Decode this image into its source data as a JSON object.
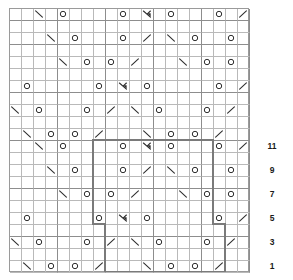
{
  "chart": {
    "type": "knitting-chart-grid",
    "columns": 20,
    "rows": 22,
    "cell_size_px": 12,
    "grid_color": "#b9b9b9",
    "major_grid_color": "#8d8d8d",
    "repeat_box_color": "#7a7a7a",
    "symbol_color": "#2e2e2e",
    "symbol_legend": {
      "O": "yarn-over",
      "/": "k2tog-right-leaning-decrease",
      "\\": "ssk-left-leaning-decrease",
      "A": "centered-double-decrease",
      "": "knit-blank"
    },
    "row_numbers": [
      {
        "label": "11",
        "row_index": 10
      },
      {
        "label": "9",
        "row_index": 8
      },
      {
        "label": "7",
        "row_index": 6
      },
      {
        "label": "5",
        "row_index": 4
      },
      {
        "label": "3",
        "row_index": 2
      },
      {
        "label": "1",
        "row_index": 0
      }
    ],
    "major_column_lines": [
      0,
      4,
      8,
      12,
      16,
      20
    ],
    "major_row_lines": [
      0,
      4,
      8,
      12,
      16,
      20,
      22
    ],
    "repeat_boxes": [
      {
        "name": "upper-repeat-box",
        "col_start": 7,
        "col_end": 17,
        "row_start": 4,
        "row_end": 11
      },
      {
        "name": "lower-repeat-box",
        "col_start": 8,
        "col_end": 18,
        "row_start": 0,
        "row_end": 4
      }
    ],
    "cells": [
      {
        "row": 21,
        "col": 4,
        "sym": "\\"
      },
      {
        "row": 21,
        "col": 6,
        "sym": "O"
      },
      {
        "row": 21,
        "col": 11,
        "sym": "O"
      },
      {
        "row": 21,
        "col": 13,
        "sym": "A"
      },
      {
        "row": 21,
        "col": 15,
        "sym": "O"
      },
      {
        "row": 21,
        "col": 19,
        "sym": "O"
      },
      {
        "row": 21,
        "col": 21,
        "sym": "/"
      },
      {
        "row": 19,
        "col": 5,
        "sym": "\\"
      },
      {
        "row": 19,
        "col": 7,
        "sym": "O"
      },
      {
        "row": 19,
        "col": 11,
        "sym": "O"
      },
      {
        "row": 19,
        "col": 13,
        "sym": "/"
      },
      {
        "row": 19,
        "col": 15,
        "sym": "\\"
      },
      {
        "row": 19,
        "col": 17,
        "sym": "O"
      },
      {
        "row": 19,
        "col": 20,
        "sym": "O"
      },
      {
        "row": 19,
        "col": 22,
        "sym": "/"
      },
      {
        "row": 17,
        "col": 6,
        "sym": "\\"
      },
      {
        "row": 17,
        "col": 8,
        "sym": "O"
      },
      {
        "row": 17,
        "col": 10,
        "sym": "O"
      },
      {
        "row": 17,
        "col": 12,
        "sym": "/"
      },
      {
        "row": 17,
        "col": 16,
        "sym": "\\"
      },
      {
        "row": 17,
        "col": 18,
        "sym": "O"
      },
      {
        "row": 17,
        "col": 20,
        "sym": "O"
      },
      {
        "row": 17,
        "col": 22,
        "sym": "/"
      },
      {
        "row": 15,
        "col": 1,
        "sym": "\\"
      },
      {
        "row": 15,
        "col": 3,
        "sym": "O"
      },
      {
        "row": 15,
        "col": 9,
        "sym": "O"
      },
      {
        "row": 15,
        "col": 11,
        "sym": "A"
      },
      {
        "row": 15,
        "col": 13,
        "sym": "O"
      },
      {
        "row": 15,
        "col": 19,
        "sym": "O"
      },
      {
        "row": 15,
        "col": 21,
        "sym": "/"
      },
      {
        "row": 13,
        "col": 2,
        "sym": "\\"
      },
      {
        "row": 13,
        "col": 4,
        "sym": "O"
      },
      {
        "row": 13,
        "col": 8,
        "sym": "O"
      },
      {
        "row": 13,
        "col": 10,
        "sym": "/"
      },
      {
        "row": 13,
        "col": 12,
        "sym": "\\"
      },
      {
        "row": 13,
        "col": 14,
        "sym": "O"
      },
      {
        "row": 13,
        "col": 18,
        "sym": "O"
      },
      {
        "row": 13,
        "col": 20,
        "sym": "/"
      },
      {
        "row": 11,
        "col": 3,
        "sym": "\\"
      },
      {
        "row": 11,
        "col": 5,
        "sym": "O"
      },
      {
        "row": 11,
        "col": 7,
        "sym": "O"
      },
      {
        "row": 11,
        "col": 9,
        "sym": "/"
      },
      {
        "row": 11,
        "col": 13,
        "sym": "\\"
      },
      {
        "row": 11,
        "col": 15,
        "sym": "O"
      },
      {
        "row": 11,
        "col": 17,
        "sym": "O"
      },
      {
        "row": 11,
        "col": 19,
        "sym": "/"
      },
      {
        "row": 10,
        "col": 4,
        "sym": "\\"
      },
      {
        "row": 10,
        "col": 6,
        "sym": "O"
      },
      {
        "row": 10,
        "col": 11,
        "sym": "O"
      },
      {
        "row": 10,
        "col": 13,
        "sym": "A"
      },
      {
        "row": 10,
        "col": 15,
        "sym": "O"
      },
      {
        "row": 10,
        "col": 19,
        "sym": "O"
      },
      {
        "row": 10,
        "col": 21,
        "sym": "/"
      },
      {
        "row": 8,
        "col": 5,
        "sym": "\\"
      },
      {
        "row": 8,
        "col": 7,
        "sym": "O"
      },
      {
        "row": 8,
        "col": 11,
        "sym": "O"
      },
      {
        "row": 8,
        "col": 13,
        "sym": "/"
      },
      {
        "row": 8,
        "col": 15,
        "sym": "\\"
      },
      {
        "row": 8,
        "col": 17,
        "sym": "O"
      },
      {
        "row": 8,
        "col": 20,
        "sym": "O"
      },
      {
        "row": 8,
        "col": 22,
        "sym": "/"
      },
      {
        "row": 6,
        "col": 6,
        "sym": "\\"
      },
      {
        "row": 6,
        "col": 8,
        "sym": "O"
      },
      {
        "row": 6,
        "col": 10,
        "sym": "O"
      },
      {
        "row": 6,
        "col": 12,
        "sym": "/"
      },
      {
        "row": 6,
        "col": 16,
        "sym": "\\"
      },
      {
        "row": 6,
        "col": 18,
        "sym": "O"
      },
      {
        "row": 6,
        "col": 20,
        "sym": "O"
      },
      {
        "row": 6,
        "col": 22,
        "sym": "/"
      },
      {
        "row": 4,
        "col": 1,
        "sym": "\\"
      },
      {
        "row": 4,
        "col": 3,
        "sym": "O"
      },
      {
        "row": 4,
        "col": 9,
        "sym": "O"
      },
      {
        "row": 4,
        "col": 11,
        "sym": "A"
      },
      {
        "row": 4,
        "col": 13,
        "sym": "O"
      },
      {
        "row": 4,
        "col": 19,
        "sym": "O"
      },
      {
        "row": 4,
        "col": 21,
        "sym": "/"
      },
      {
        "row": 2,
        "col": 2,
        "sym": "\\"
      },
      {
        "row": 2,
        "col": 4,
        "sym": "O"
      },
      {
        "row": 2,
        "col": 8,
        "sym": "O"
      },
      {
        "row": 2,
        "col": 10,
        "sym": "/"
      },
      {
        "row": 2,
        "col": 12,
        "sym": "\\"
      },
      {
        "row": 2,
        "col": 14,
        "sym": "O"
      },
      {
        "row": 2,
        "col": 18,
        "sym": "O"
      },
      {
        "row": 2,
        "col": 20,
        "sym": "/"
      },
      {
        "row": 0,
        "col": 3,
        "sym": "\\"
      },
      {
        "row": 0,
        "col": 5,
        "sym": "O"
      },
      {
        "row": 0,
        "col": 7,
        "sym": "O"
      },
      {
        "row": 0,
        "col": 9,
        "sym": "/"
      },
      {
        "row": 0,
        "col": 13,
        "sym": "\\"
      },
      {
        "row": 0,
        "col": 15,
        "sym": "O"
      },
      {
        "row": 0,
        "col": 17,
        "sym": "O"
      },
      {
        "row": 0,
        "col": 19,
        "sym": "/"
      }
    ]
  }
}
